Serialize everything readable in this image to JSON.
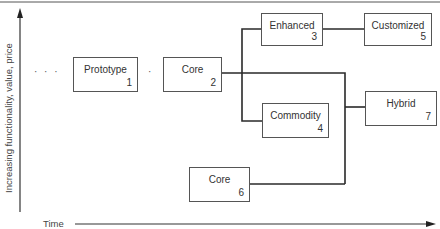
{
  "axes": {
    "y_label": "Increasing functionality, value, price",
    "x_label": "Time"
  },
  "ellipsis": {
    "left": "· · ·",
    "between": "·"
  },
  "nodes": [
    {
      "id": 1,
      "label": "Prototype",
      "number": "1"
    },
    {
      "id": 2,
      "label": "Core",
      "number": "2"
    },
    {
      "id": 3,
      "label": "Enhanced",
      "number": "3"
    },
    {
      "id": 4,
      "label": "Commodity",
      "number": "4"
    },
    {
      "id": 5,
      "label": "Customized",
      "number": "5"
    },
    {
      "id": 6,
      "label": "Core",
      "number": "6"
    },
    {
      "id": 7,
      "label": "Hybrid",
      "number": "7"
    }
  ],
  "edges": [
    {
      "from": 1,
      "to": 2
    },
    {
      "from": 2,
      "to": 3
    },
    {
      "from": 2,
      "to": 4
    },
    {
      "from": 2,
      "to": 7
    },
    {
      "from": 3,
      "to": 5
    },
    {
      "from": 6,
      "to": 7
    }
  ],
  "colors": {
    "line": "#2a2a2a",
    "box_border": "#555555",
    "text": "#333333"
  }
}
